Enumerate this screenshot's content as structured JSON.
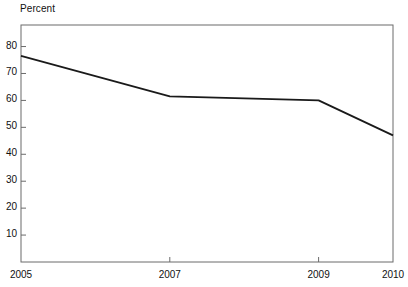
{
  "chart_data": {
    "type": "line",
    "title": "",
    "ylabel": "Percent",
    "xlabel": "",
    "x": [
      2005,
      2007,
      2009,
      2010
    ],
    "categories": [
      "2005",
      "2007",
      "2009",
      "2010"
    ],
    "values": [
      76.5,
      61.5,
      60.0,
      47.0
    ],
    "series": [
      {
        "name": "Percent",
        "values": [
          76.5,
          61.5,
          60.0,
          47.0
        ],
        "color": "#1a1a1a"
      }
    ],
    "ylim": [
      0,
      88
    ],
    "xlim": [
      2005,
      2010
    ],
    "yticks": [
      10,
      20,
      30,
      40,
      50,
      60,
      70,
      80
    ],
    "ytick_labels": [
      "10",
      "20",
      "30",
      "40",
      "50",
      "60",
      "70",
      "80"
    ],
    "xticks": [
      2005,
      2007,
      2009,
      2010
    ],
    "xtick_labels": [
      "2005",
      "2007",
      "2009",
      "2010"
    ],
    "grid": false,
    "legend": "none",
    "frame": "box",
    "line_color": "#1a1a1a",
    "axis_color": "#6b6b6b"
  }
}
